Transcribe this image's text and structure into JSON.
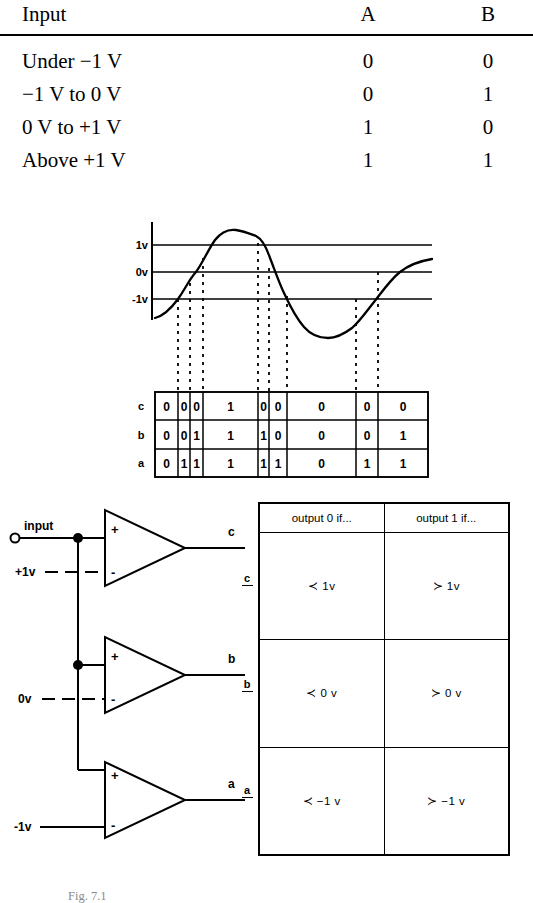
{
  "truth_table": {
    "headers": {
      "input": "Input",
      "a": "A",
      "b": "B"
    },
    "rows": [
      {
        "input": "Under −1 V",
        "a": "0",
        "b": "0"
      },
      {
        "input": "−1 V to 0 V",
        "a": "0",
        "b": "1"
      },
      {
        "input": "0 V to +1 V",
        "a": "1",
        "b": "0"
      },
      {
        "input": "Above +1 V",
        "a": "1",
        "b": "1"
      }
    ]
  },
  "waveform": {
    "axis_labels": {
      "high": "1v",
      "mid": "0v",
      "low": "-1v"
    },
    "threshold_lines": [
      "1v",
      "0v",
      "-1v"
    ],
    "dashed_drop_x": [
      178,
      190,
      203,
      258,
      269,
      287,
      356,
      378
    ],
    "curve_description": "analog input sweeping from below -1v up through +1v, peaking, falling through all thresholds to a minimum, then rising back above 0v",
    "bit_table": {
      "row_labels": [
        "c",
        "b",
        "a"
      ],
      "column_edges": [
        155,
        178,
        190,
        203,
        258,
        269,
        287,
        356,
        378,
        428
      ],
      "rows": [
        {
          "label": "c",
          "values": [
            "0",
            "0",
            "0",
            "1",
            "0",
            "0",
            "0",
            "0",
            "0"
          ]
        },
        {
          "label": "b",
          "values": [
            "0",
            "0",
            "1",
            "1",
            "1",
            "0",
            "0",
            "0",
            "1"
          ]
        },
        {
          "label": "a",
          "values": [
            "0",
            "1",
            "1",
            "1",
            "1",
            "1",
            "0",
            "1",
            "1"
          ]
        }
      ]
    }
  },
  "circuit": {
    "input_label": "input",
    "comparators": [
      {
        "output": "c",
        "reference": "+1v",
        "plus": "+",
        "minus": "-"
      },
      {
        "output": "b",
        "reference": "0v",
        "plus": "+",
        "minus": "-"
      },
      {
        "output": "a",
        "reference": "-1v",
        "plus": "+",
        "minus": "-"
      }
    ]
  },
  "condition_table": {
    "headers": {
      "zero": "output 0 if...",
      "one": "output 1 if..."
    },
    "rows": [
      {
        "label": "c",
        "zero": "≺ 1v",
        "one": "≻ 1v"
      },
      {
        "label": "b",
        "zero": "≺ 0 v",
        "one": "≻ 0 v"
      },
      {
        "label": "a",
        "zero": "≺ −1 v",
        "one": "≻ −1 v"
      }
    ]
  },
  "caption": {
    "text": "Fig. 7.1"
  }
}
